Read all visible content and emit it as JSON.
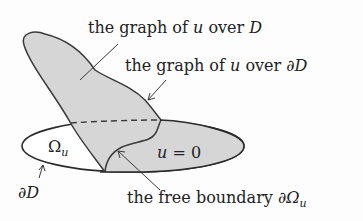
{
  "diagram": {
    "colors": {
      "fill": "#d6d6d6",
      "stroke": "#3a3a3a",
      "text": "#222222",
      "background": "#fdfdfd"
    },
    "labels": {
      "graph_over_D": {
        "prefix": "the graph of ",
        "var": "u",
        "mid": " over ",
        "suffix": "D"
      },
      "graph_over_dD": {
        "prefix": "the graph of ",
        "var": "u",
        "mid": " over ",
        "suffix": "∂D"
      },
      "omega_u": {
        "sym": "Ω",
        "sub": "u"
      },
      "u_zero": {
        "var": "u",
        "rest": " = 0"
      },
      "dD": "∂D",
      "free_boundary": {
        "prefix": "the free boundary ",
        "sym": "∂Ω",
        "sub": "u"
      }
    }
  }
}
